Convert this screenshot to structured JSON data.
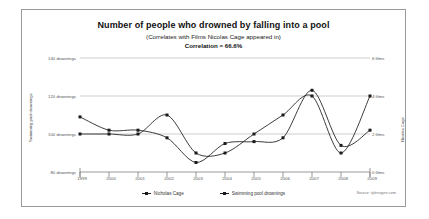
{
  "chart_data": {
    "type": "line",
    "title": "Number of people who drowned by falling into a pool",
    "subtitle": "(Correlates with Films Nicolas Cage appeared in)",
    "correlation_text": "Correlation = 66.6%",
    "correlation_value": 66.6,
    "source": "Source: tylervigen.com",
    "x": [
      1999,
      2000,
      2001,
      2002,
      2003,
      2004,
      2005,
      2006,
      2007,
      2008,
      2009
    ],
    "categories": [
      "1999",
      "2000",
      "2001",
      "2002",
      "2003",
      "2004",
      "2005",
      "2006",
      "2007",
      "2008",
      "2009"
    ],
    "xlabel": "",
    "grid": true,
    "legend_position": "bottom",
    "series": [
      {
        "name": "Nicholas Cage",
        "axis": "right",
        "ylabel": "Nicolas Cage",
        "unit": "films",
        "ylim": [
          0,
          6
        ],
        "yticks": [
          0,
          2,
          4,
          6
        ],
        "ytick_labels": [
          "0 films",
          "2 films",
          "4 films",
          "6 films"
        ],
        "values": [
          2,
          2,
          2,
          3,
          1,
          1,
          2,
          3,
          4,
          1,
          4
        ],
        "color": "#1a1a1a"
      },
      {
        "name": "Swimming pool drownings",
        "axis": "left",
        "ylabel": "Swimming pool drownings",
        "unit": "drownings",
        "ylim": [
          80,
          140
        ],
        "yticks": [
          80,
          100,
          120,
          140
        ],
        "ytick_labels": [
          "80 drownings",
          "100 drownings",
          "120 drownings",
          "140 drownings"
        ],
        "values": [
          109,
          102,
          102,
          98,
          85,
          95,
          96,
          98,
          123,
          94,
          102
        ],
        "color": "#1a1a1a"
      }
    ]
  },
  "legend": {
    "items": [
      {
        "label": "Nicholas Cage"
      },
      {
        "label": "Swimming pool drownings"
      }
    ]
  }
}
